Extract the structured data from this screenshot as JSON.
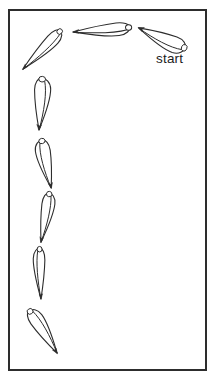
{
  "figure": {
    "label_start": "start",
    "line_color": "#2d2d2d",
    "background_color": "#ffffff",
    "frame": {
      "x": 9,
      "y": 10,
      "width": 197,
      "height": 360,
      "stroke_width": 2
    },
    "seeds": [
      {
        "name": "seed-pos-1-start",
        "x": 185,
        "y": 49,
        "angle": 204.5,
        "len": 1.02,
        "w": 1.25,
        "flip": -1
      },
      {
        "name": "seed-pos-2",
        "x": 130,
        "y": 28,
        "angle": 176.0,
        "len": 1.14,
        "w": 1.0,
        "flip": -1
      },
      {
        "name": "seed-pos-3",
        "x": 61,
        "y": 31,
        "angle": 135.0,
        "len": 1.08,
        "w": 0.95,
        "flip": -1
      },
      {
        "name": "seed-pos-4",
        "x": 43,
        "y": 78,
        "angle": 94.4,
        "len": 1.04,
        "w": 1.25,
        "flip": -1
      },
      {
        "name": "seed-pos-5",
        "x": 41,
        "y": 140,
        "angle": 78.0,
        "len": 0.98,
        "w": 1.15,
        "flip": 1
      },
      {
        "name": "seed-pos-6",
        "x": 50,
        "y": 193,
        "angle": 100.4,
        "len": 1.0,
        "w": 1.0,
        "flip": -1
      },
      {
        "name": "seed-pos-7",
        "x": 39,
        "y": 248,
        "angle": 87.8,
        "len": 1.02,
        "w": 0.9,
        "flip": 1
      },
      {
        "name": "seed-pos-8",
        "x": 30,
        "y": 310,
        "angle": 57.9,
        "len": 1.02,
        "w": 1.1,
        "flip": -1
      }
    ]
  }
}
